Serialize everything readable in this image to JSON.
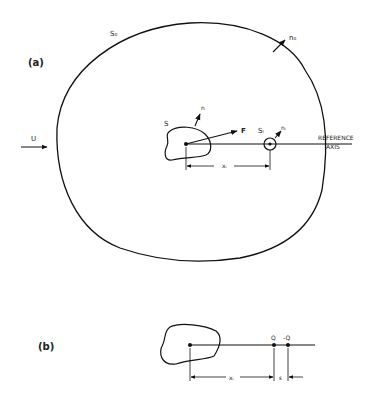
{
  "panel_a": {
    "label": "(a)",
    "outer_surface": "S₀",
    "outer_normal": "n₀",
    "body_surface": "S",
    "body_normal": "n",
    "force": "F",
    "freestream": "U",
    "small_surface": "Sᵢ",
    "small_normal": "nᵢ",
    "distance": "xᵢ",
    "axis_label_line1": "REFERENCE",
    "axis_label_line2": "AXIS"
  },
  "panel_b": {
    "label": "(b)",
    "source": "Q",
    "sink": "-Q",
    "distance": "xᵢ",
    "separation": "ε"
  }
}
